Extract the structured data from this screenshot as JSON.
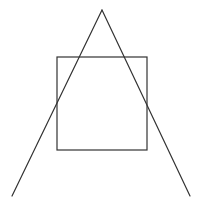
{
  "diagram": {
    "width": 202,
    "height": 208,
    "background": "#ffffff",
    "stroke_color": "#333333",
    "square": {
      "x": 57,
      "y": 57,
      "width": 90,
      "height": 93,
      "stroke_width": 1.2
    },
    "triangle_lines": [
      {
        "name": "left-line",
        "x1": 102,
        "y1": 10,
        "x2": 12,
        "y2": 196
      },
      {
        "name": "right-line",
        "x1": 102,
        "y1": 10,
        "x2": 190,
        "y2": 196
      }
    ],
    "line_stroke_width": 1.2
  }
}
